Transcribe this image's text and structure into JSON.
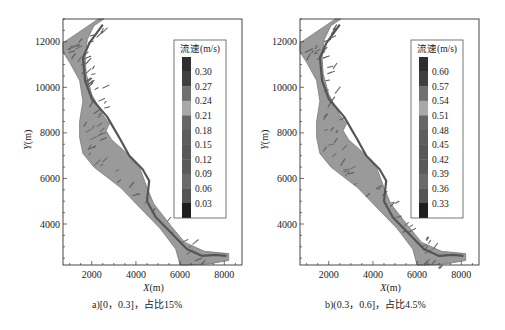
{
  "figure": {
    "panels": [
      {
        "id": "a",
        "caption": "a)[0，0.3]，占比15%",
        "legend": {
          "title": "流速(m/s)",
          "labels": [
            "0.30",
            "0.27",
            "0.24",
            "0.21",
            "0.18",
            "0.15",
            "0.12",
            "0.09",
            "0.06",
            "0.03"
          ]
        }
      },
      {
        "id": "b",
        "caption": "b)(0.3，0.6]，占比4.5%",
        "legend": {
          "title": "流速(m/s)",
          "labels": [
            "0.60",
            "0.57",
            "0.54",
            "0.51",
            "0.48",
            "0.45",
            "0.42",
            "0.39",
            "0.36",
            "0.33"
          ]
        }
      }
    ],
    "axes": {
      "xlabel_italic": "X",
      "xlabel_unit": "(m)",
      "ylabel_italic": "Y",
      "ylabel_unit": "(m)",
      "xticks": [
        "2000",
        "4000",
        "6000",
        "8000"
      ],
      "yticks": [
        "12000",
        "10000",
        "8000",
        "6000",
        "4000"
      ]
    },
    "colors": {
      "river_fill": "#9a9a9a",
      "river_edge": "#7a7a7a",
      "thalweg": "#555555",
      "legend_bands": [
        "#2e2e2e",
        "#3f3f3f",
        "#707070",
        "#a8a8a8",
        "#666666",
        "#5c5c5c",
        "#575757",
        "#5a5a5a",
        "#6a6a6a",
        "#555555",
        "#1e1e1e"
      ]
    }
  },
  "chart_data": [
    {
      "type": "heatmap",
      "title": "a)[0，0.3]，占比15%",
      "xlabel": "X(m)",
      "ylabel": "Y(m)",
      "xlim": [
        700,
        8800
      ],
      "ylim": [
        2200,
        13000
      ],
      "xticks": [
        2000,
        4000,
        6000,
        8000
      ],
      "yticks": [
        4000,
        6000,
        8000,
        10000,
        12000
      ],
      "colorbar": {
        "title": "流速(m/s)",
        "levels": [
          0.03,
          0.06,
          0.09,
          0.12,
          0.15,
          0.18,
          0.21,
          0.24,
          0.27,
          0.3
        ],
        "range": [
          0,
          0.3
        ]
      },
      "velocity_range": "[0, 0.3]",
      "area_share_percent": 15,
      "legend_position": "upper right inside",
      "grid": false
    },
    {
      "type": "heatmap",
      "title": "b)(0.3，0.6]，占比4.5%",
      "xlabel": "X(m)",
      "ylabel": "Y(m)",
      "xlim": [
        700,
        8800
      ],
      "ylim": [
        2200,
        13000
      ],
      "xticks": [
        2000,
        4000,
        6000,
        8000
      ],
      "yticks": [
        4000,
        6000,
        8000,
        10000,
        12000
      ],
      "colorbar": {
        "title": "流速(m/s)",
        "levels": [
          0.33,
          0.36,
          0.39,
          0.42,
          0.45,
          0.48,
          0.51,
          0.54,
          0.57,
          0.6
        ],
        "range": [
          0.3,
          0.6
        ]
      },
      "velocity_range": "(0.3, 0.6]",
      "area_share_percent": 4.5,
      "legend_position": "upper right inside",
      "grid": false
    }
  ]
}
